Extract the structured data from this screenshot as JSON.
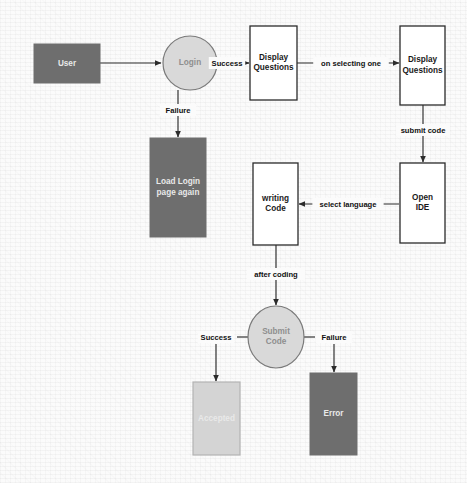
{
  "diagram": {
    "canvas": {
      "width": 467,
      "height": 483
    },
    "palette": {
      "dark_fill": "#6e6e6e",
      "light_fill": "#d4d4d4",
      "ellipse_fill": "#d9d9d9",
      "white_fill": "#ffffff",
      "stroke": "#2b2b2b",
      "light_text": "#e9e9e9",
      "dark_text": "#1a1a1a",
      "mid_text": "#8e8e8e",
      "background": "#fbfbfb"
    },
    "nodes": [
      {
        "id": "user",
        "label": "User",
        "label_lines": [
          "User"
        ],
        "shape": "rect",
        "style": "dark",
        "text_style": "light",
        "x": 34,
        "y": 44,
        "w": 66,
        "h": 39
      },
      {
        "id": "login",
        "label": "Login",
        "label_lines": [
          "Login"
        ],
        "shape": "ellipse",
        "style": "ellipse",
        "text_style": "mid",
        "cx": 190,
        "cy": 63,
        "rx": 27,
        "ry": 27
      },
      {
        "id": "display-questions-1",
        "label": "Display Questions",
        "label_lines": [
          "Display",
          "Questions"
        ],
        "shape": "rect",
        "style": "white",
        "text_style": "dark",
        "x": 250,
        "y": 26,
        "w": 47,
        "h": 74
      },
      {
        "id": "display-questions-2",
        "label": "Display Questions",
        "label_lines": [
          "Display",
          "Questions"
        ],
        "shape": "rect",
        "style": "white",
        "text_style": "dark",
        "x": 400,
        "y": 26,
        "w": 45,
        "h": 79
      },
      {
        "id": "load-login-page-again",
        "label": "Load Login page again",
        "label_lines": [
          "Load Login",
          "page again"
        ],
        "shape": "rect",
        "style": "dark",
        "text_style": "light",
        "x": 150,
        "y": 138,
        "w": 56,
        "h": 99
      },
      {
        "id": "open-ide",
        "label": "Open IDE",
        "label_lines": [
          "Open",
          "IDE"
        ],
        "shape": "rect",
        "style": "white",
        "text_style": "dark",
        "x": 400,
        "y": 163,
        "w": 45,
        "h": 80
      },
      {
        "id": "writing-code",
        "label": "writing Code",
        "label_lines": [
          "writing",
          "Code"
        ],
        "shape": "rect",
        "style": "white",
        "text_style": "dark",
        "x": 253,
        "y": 163,
        "w": 45,
        "h": 82
      },
      {
        "id": "submit-code",
        "label": "Submit Code",
        "label_lines": [
          "Submit",
          "Code"
        ],
        "shape": "ellipse",
        "style": "ellipse",
        "text_style": "mid",
        "cx": 276,
        "cy": 337,
        "rx": 28,
        "ry": 31
      },
      {
        "id": "accepted",
        "label": "Accepted",
        "label_lines": [
          "Accepted"
        ],
        "shape": "rect",
        "style": "light",
        "text_style": "light",
        "x": 193,
        "y": 382,
        "w": 47,
        "h": 73
      },
      {
        "id": "error",
        "label": "Error",
        "label_lines": [
          "Error"
        ],
        "shape": "rect",
        "style": "dark",
        "text_style": "light",
        "x": 310,
        "y": 373,
        "w": 47,
        "h": 82
      }
    ],
    "edges": [
      {
        "id": "user-to-login",
        "from": "user",
        "to": "login",
        "label": "",
        "points": [
          [
            100,
            63
          ],
          [
            161,
            63
          ]
        ],
        "arrow": "end"
      },
      {
        "id": "login-to-display-questions-1",
        "from": "login",
        "to": "display-questions-1",
        "label": "Success",
        "label_x": 227,
        "label_y": 63,
        "points": [
          [
            217,
            63
          ],
          [
            249,
            63
          ]
        ],
        "arrow": "end",
        "gap": [
          [
            217,
            63
          ],
          [
            221,
            63
          ]
        ]
      },
      {
        "id": "display-questions-1-to-display-questions-2",
        "from": "display-questions-1",
        "to": "display-questions-2",
        "label": "on selecting one",
        "label_x": 351,
        "label_y": 63,
        "points": [
          [
            297,
            63
          ],
          [
            399,
            63
          ]
        ],
        "arrow": "end"
      },
      {
        "id": "login-to-load-login-page-again",
        "from": "login",
        "to": "load-login-page-again",
        "label": "Failure",
        "label_x": 178,
        "label_y": 110,
        "points": [
          [
            178,
            90
          ],
          [
            178,
            137
          ]
        ],
        "arrow": "end"
      },
      {
        "id": "display-questions-2-to-open-ide",
        "from": "display-questions-2",
        "to": "open-ide",
        "label": "submit code",
        "label_x": 423,
        "label_y": 130,
        "points": [
          [
            423,
            105
          ],
          [
            423,
            162
          ]
        ],
        "arrow": "end"
      },
      {
        "id": "open-ide-to-writing-code",
        "from": "open-ide",
        "to": "writing-code",
        "label": "select language",
        "label_x": 348,
        "label_y": 204,
        "points": [
          [
            399,
            204
          ],
          [
            299,
            204
          ]
        ],
        "arrow": "end"
      },
      {
        "id": "writing-code-to-submit-code",
        "from": "writing-code",
        "to": "submit-code",
        "label": "after coding",
        "label_x": 276,
        "label_y": 274,
        "points": [
          [
            276,
            245
          ],
          [
            276,
            305
          ]
        ],
        "arrow": "end"
      },
      {
        "id": "submit-code-to-accepted",
        "from": "submit-code",
        "to": "accepted",
        "label": "Success",
        "label_x": 216,
        "label_y": 337,
        "points": [
          [
            216,
            344
          ],
          [
            216,
            381
          ]
        ],
        "arrow": "end",
        "stub": [
          [
            248,
            337
          ],
          [
            237,
            337
          ]
        ]
      },
      {
        "id": "submit-code-to-error",
        "from": "submit-code",
        "to": "error",
        "label": "Failure",
        "label_x": 334,
        "label_y": 337,
        "points": [
          [
            334,
            344
          ],
          [
            334,
            372
          ]
        ],
        "arrow": "end",
        "stub": [
          [
            304,
            337
          ],
          [
            315,
            337
          ]
        ]
      }
    ]
  }
}
